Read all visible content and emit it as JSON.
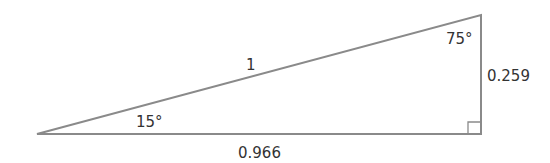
{
  "diagram": {
    "type": "right-triangle",
    "line_color": "#8a8a8a",
    "text_color": "#333333",
    "labels": {
      "hypotenuse": "1",
      "adjacent": "0.966",
      "opposite": "0.259",
      "angle_left": "15°",
      "angle_top": "75°"
    }
  }
}
